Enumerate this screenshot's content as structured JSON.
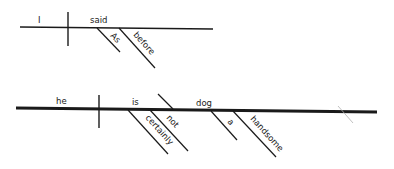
{
  "diagram": {
    "type": "sentence-diagram",
    "colors": {
      "ink": "#1a1a1a",
      "faint": "#9a9a9a",
      "background": "#ffffff"
    },
    "sentences": [
      {
        "subject": "I",
        "verb": "said",
        "modifiers": [
          {
            "word": "As",
            "attaches_to": "said"
          },
          {
            "word": "before",
            "attaches_to": "said"
          }
        ]
      },
      {
        "subject": "he",
        "verb": "is",
        "predicate_nominative": "dog",
        "modifiers": [
          {
            "word": "certainly",
            "attaches_to": "is"
          },
          {
            "word": "not",
            "attaches_to": "is"
          },
          {
            "word": "a",
            "attaches_to": "dog"
          },
          {
            "word": "handsome",
            "attaches_to": "dog"
          }
        ]
      }
    ]
  }
}
